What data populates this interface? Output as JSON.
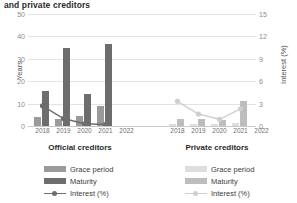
{
  "title": "and private creditors",
  "axes": {
    "ylabel_left": "Years",
    "ylabel_right": "Interest (%)",
    "yticks_left": [
      "50",
      "40",
      "30",
      "20",
      "10",
      "0"
    ],
    "yticks_right": [
      "15",
      "12",
      "9",
      "6",
      "3",
      "0"
    ]
  },
  "panels": [
    {
      "caption": "Official creditors",
      "xticks": [
        "2018",
        "2019",
        "2020",
        "2021",
        "2022"
      ],
      "legend": [
        {
          "label": "Grace period",
          "type": "swatch",
          "color": "#9a9a9a"
        },
        {
          "label": "Maturity",
          "type": "swatch",
          "color": "#6d6d6d"
        },
        {
          "label": "Interest (%)",
          "type": "line",
          "color": "#6d6d6d"
        }
      ]
    },
    {
      "caption": "Private creditors",
      "xticks": [
        "2018",
        "2019",
        "2020",
        "2021",
        "2022"
      ],
      "legend": [
        {
          "label": "Grace period",
          "type": "swatch",
          "color": "#dedede"
        },
        {
          "label": "Maturity",
          "type": "swatch",
          "color": "#bdbdbd"
        },
        {
          "label": "Interest (%)",
          "type": "line",
          "color": "#cfcfcf"
        }
      ]
    }
  ],
  "chart_data": [
    {
      "type": "bar",
      "title": "Official creditors",
      "xlabel": "",
      "ylabel": "Years",
      "ylim": [
        0,
        50
      ],
      "y2label": "Interest (%)",
      "y2lim": [
        0,
        15
      ],
      "grid": true,
      "legend_position": "below",
      "categories": [
        "2018",
        "2019",
        "2020",
        "2021",
        "2022"
      ],
      "series": [
        {
          "name": "Grace period",
          "axis": "left",
          "kind": "bar",
          "color": "#9a9a9a",
          "values": [
            4.0,
            3.0,
            4.5,
            8.8,
            0
          ]
        },
        {
          "name": "Maturity",
          "axis": "left",
          "kind": "bar",
          "color": "#6d6d6d",
          "values": [
            15.5,
            35.0,
            14.2,
            36.5,
            0
          ]
        },
        {
          "name": "Interest (%)",
          "axis": "right",
          "kind": "line",
          "color": "#6d6d6d",
          "values": [
            2.7,
            1.0,
            0.3,
            0.2,
            0
          ]
        }
      ]
    },
    {
      "type": "bar",
      "title": "Private creditors",
      "xlabel": "",
      "ylabel": "Years",
      "ylim": [
        0,
        50
      ],
      "y2label": "Interest (%)",
      "y2lim": [
        0,
        15
      ],
      "grid": true,
      "legend_position": "below",
      "categories": [
        "2018",
        "2019",
        "2020",
        "2021",
        "2022"
      ],
      "series": [
        {
          "name": "Grace period",
          "axis": "left",
          "kind": "bar",
          "color": "#dedede",
          "values": [
            0.8,
            1.0,
            0.8,
            1.2,
            0
          ]
        },
        {
          "name": "Maturity",
          "axis": "left",
          "kind": "bar",
          "color": "#bdbdbd",
          "values": [
            3.2,
            3.0,
            2.6,
            11.0,
            0
          ]
        },
        {
          "name": "Interest (%)",
          "axis": "right",
          "kind": "line",
          "color": "#cfcfcf",
          "values": [
            3.3,
            1.6,
            0.9,
            2.3,
            0
          ]
        }
      ]
    }
  ]
}
